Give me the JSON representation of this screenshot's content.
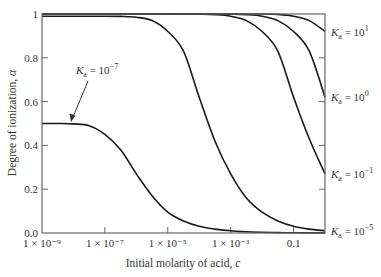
{
  "chart_data": {
    "type": "line",
    "title": "",
    "xlabel": "Initial molarity of acid, c",
    "ylabel": "Degree of ionization, α",
    "xscale": "log",
    "xlim_log10": [
      -9,
      0
    ],
    "ylim": [
      0,
      1
    ],
    "grid": false,
    "legend": "inline labels",
    "x_ticks": [
      {
        "log10": -9,
        "label": "1 × 10⁻⁹"
      },
      {
        "log10": -7,
        "label": "1 × 10⁻⁷"
      },
      {
        "log10": -5,
        "label": "1 × 10⁻⁵"
      },
      {
        "log10": -3,
        "label": "1 × 10⁻³"
      },
      {
        "log10": -1,
        "label": "0.1"
      }
    ],
    "y_ticks": [
      {
        "value": 0,
        "label": "0.0"
      },
      {
        "value": 0.2,
        "label": "0.2"
      },
      {
        "value": 0.4,
        "label": "0.4"
      },
      {
        "value": 0.6,
        "label": "0.6"
      },
      {
        "value": 0.8,
        "label": "0.8"
      },
      {
        "value": 1,
        "label": "1"
      }
    ],
    "x_log10": [
      -9,
      -8.5,
      -8,
      -7.5,
      -7,
      -6.5,
      -6,
      -5.5,
      -5,
      -4.5,
      -4,
      -3.5,
      -3,
      -2.5,
      -2,
      -1.5,
      -1,
      -0.5,
      0
    ],
    "series": [
      {
        "name": "Ka = 10^1",
        "label_base": "K",
        "label_sub": "a",
        "label_exp": "1",
        "values": [
          1,
          1,
          1,
          1,
          1,
          1,
          1,
          1,
          1,
          1,
          1,
          1,
          1,
          1,
          1,
          0.998,
          0.99,
          0.97,
          0.92
        ]
      },
      {
        "name": "Ka = 10^0",
        "label_base": "K",
        "label_sub": "a",
        "label_exp": "0",
        "values": [
          1,
          1,
          1,
          1,
          1,
          1,
          1,
          1,
          1,
          1,
          1,
          1,
          0.999,
          0.997,
          0.99,
          0.97,
          0.92,
          0.83,
          0.62
        ]
      },
      {
        "name": "Ka = 10^-1",
        "label_base": "K",
        "label_sub": "a",
        "label_exp": "−1",
        "values": [
          1,
          1,
          1,
          1,
          1,
          1,
          1,
          1,
          1,
          0.999,
          0.999,
          0.997,
          0.99,
          0.97,
          0.92,
          0.83,
          0.62,
          0.43,
          0.27
        ]
      },
      {
        "name": "Ka = 10^-5",
        "label_base": "K",
        "label_sub": "a",
        "label_exp": "−5",
        "values": [
          0.99,
          0.99,
          0.99,
          0.99,
          0.99,
          0.989,
          0.985,
          0.97,
          0.92,
          0.83,
          0.62,
          0.42,
          0.27,
          0.16,
          0.095,
          0.055,
          0.031,
          0.018,
          0.01
        ]
      },
      {
        "name": "Ka = 10^-7",
        "label_base": "K",
        "label_sub": "a",
        "label_exp": "−7",
        "values": [
          0.5,
          0.5,
          0.498,
          0.49,
          0.45,
          0.38,
          0.27,
          0.17,
          0.095,
          0.055,
          0.031,
          0.018,
          0.01,
          0.0056,
          0.003,
          0.0018,
          0.001,
          0.0006,
          0.0003
        ]
      }
    ],
    "annotations": [
      {
        "text": "Ka = 10^-7",
        "arrow_to_series": "Ka = 10^-7",
        "arrow_target_log10": -7.5,
        "arrow_target_value": 0.5
      }
    ]
  },
  "labels": {
    "ylabel_text": "Degree of ionization, ",
    "ylabel_symbol": "α",
    "xlabel_text": "Initial molarity of acid, ",
    "xlabel_symbol": "c",
    "eq": " = 10"
  }
}
